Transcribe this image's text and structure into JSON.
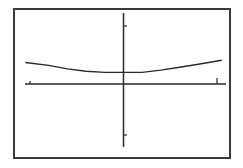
{
  "chart_data": {
    "type": "line",
    "title": "",
    "xlabel": "",
    "ylabel": "",
    "grid": false,
    "legend": null,
    "axes": {
      "x_ticks": [
        -1,
        1
      ],
      "y_ticks": [
        -1,
        1
      ],
      "xlim": [
        -1.05,
        1.08
      ],
      "ylim": [
        -1.3,
        1.25
      ]
    },
    "series": [
      {
        "name": "curve",
        "x": [
          -1.05,
          -0.8,
          -0.6,
          -0.4,
          -0.2,
          0,
          0.2,
          0.4,
          0.6,
          0.8,
          1.05
        ],
        "y": [
          0.37,
          0.32,
          0.26,
          0.22,
          0.2,
          0.2,
          0.2,
          0.24,
          0.29,
          0.34,
          0.41
        ]
      }
    ]
  },
  "colors": {
    "frame": "#3a3a3a",
    "axes": "#2a2a2a",
    "curve": "#2a2a2a",
    "background": "#ffffff"
  }
}
